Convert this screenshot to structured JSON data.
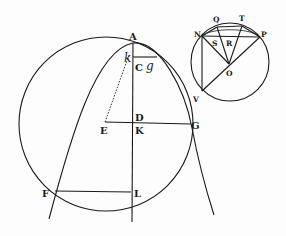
{
  "diagram": {
    "type": "geometric-figure",
    "ink_color": "#1a1a1a",
    "background": "#fdfdfd",
    "main_figure": {
      "labels": {
        "A": "A",
        "k": "k",
        "C": "C",
        "g": "g",
        "D": "D",
        "E": "E",
        "K": "K",
        "G": "G",
        "F": "F",
        "L": "L"
      },
      "elements": [
        "large circle",
        "parabola-like curve through A, F, G",
        "vertical axis through A, C, D, K, L",
        "segment E–G",
        "dotted segment E–k",
        "segment k–g",
        "segment F–L"
      ]
    },
    "inset_figure": {
      "labels": {
        "Q": "Q",
        "T": "T",
        "N": "N",
        "P": "P",
        "S": "S",
        "R": "R",
        "O": "O",
        "V": "V"
      },
      "elements": [
        "small circle",
        "chord N–P",
        "chord Q–T",
        "lines from O to N, Q, T, P",
        "line N–V",
        "line V–P through O"
      ]
    }
  }
}
